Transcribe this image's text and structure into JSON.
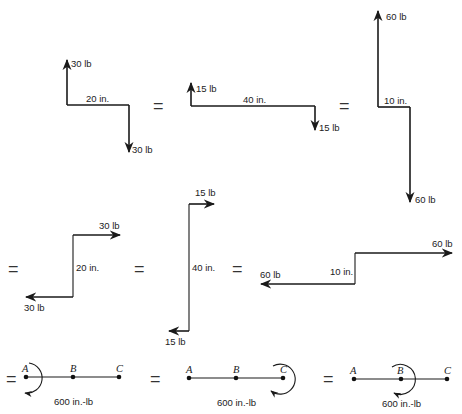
{
  "figure": {
    "equals_sign": "=",
    "row1": {
      "couple1": {
        "force_top": "30 lb",
        "force_bottom": "30 lb",
        "arm": "20 in."
      },
      "couple2": {
        "force_top": "15 lb",
        "force_bottom": "15 lb",
        "arm": "40 in."
      },
      "couple3": {
        "force_top": "60 lb",
        "force_bottom": "60 lb",
        "arm": "10 in."
      }
    },
    "row2": {
      "couple1": {
        "force_top": "30 lb",
        "force_bottom": "30 lb",
        "arm": "20 in."
      },
      "couple2": {
        "force_top": "15 lb",
        "force_bottom": "15 lb",
        "arm": "40 in."
      },
      "couple3": {
        "force_top": "60 lb",
        "force_bottom": "60 lb",
        "arm": "10 in."
      }
    },
    "row3": {
      "beam1": {
        "points": [
          "A",
          "B",
          "C"
        ],
        "moment_at": "A",
        "moment": "600 in.-lb"
      },
      "beam2": {
        "points": [
          "A",
          "B",
          "C"
        ],
        "moment_at": "C",
        "moment": "600 in.-lb"
      },
      "beam3": {
        "points": [
          "A",
          "B",
          "C"
        ],
        "moment_at": "B",
        "moment": "600 in.-lb"
      }
    }
  }
}
